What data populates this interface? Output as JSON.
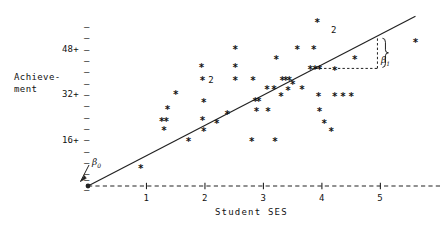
{
  "chart_data": {
    "type": "scatter",
    "title": "",
    "xlabel": "Student SES",
    "ylabel_line1": "Achieve-",
    "ylabel_line2": "ment",
    "xlim": [
      0,
      5.9
    ],
    "ylim": [
      0,
      60
    ],
    "xticks": [
      "1",
      "2",
      "3",
      "4",
      "5"
    ],
    "xtick_values": [
      1,
      2,
      3,
      4,
      5
    ],
    "ytick_labels": [
      "48+",
      "32+",
      "16+"
    ],
    "ytick_values": [
      48,
      32,
      16
    ],
    "ytick_dash_values": [
      56,
      52,
      48,
      44,
      40,
      36,
      32,
      28,
      24,
      20,
      16,
      12,
      8,
      4
    ],
    "grid": false,
    "legend": false,
    "marker_glyph": "*",
    "line_color": "#222222",
    "axis_color": "#222222",
    "marker_color": "#111111",
    "regression_line": {
      "intercept": 0,
      "slope": 10.7,
      "x_start": 0,
      "x_end": 5.6
    },
    "annotations": [
      {
        "name": "beta0",
        "text": "β",
        "sub": "0",
        "x": 0.18,
        "y": 6.5,
        "arrow_to_x": 0.02,
        "arrow_to_y": 0.6
      },
      {
        "name": "beta1",
        "text": "β",
        "sub": "1",
        "x": 5.25,
        "y": 44.0
      }
    ],
    "slope_triangle": {
      "x_left": 3.88,
      "x_right": 4.95,
      "y_bottom": 41.5,
      "y_top": 52.5,
      "style": "dashed"
    },
    "points": [
      {
        "x": 0.9,
        "y": 6.0,
        "n": 1
      },
      {
        "x": 1.26,
        "y": 22.5,
        "n": 1
      },
      {
        "x": 1.34,
        "y": 22.5,
        "n": 1
      },
      {
        "x": 1.3,
        "y": 19.5,
        "n": 1
      },
      {
        "x": 1.36,
        "y": 27.0,
        "n": 1
      },
      {
        "x": 1.5,
        "y": 32.0,
        "n": 1
      },
      {
        "x": 1.72,
        "y": 15.5,
        "n": 1
      },
      {
        "x": 1.96,
        "y": 22.8,
        "n": 1
      },
      {
        "x": 1.98,
        "y": 19.2,
        "n": 1
      },
      {
        "x": 1.98,
        "y": 29.3,
        "n": 1
      },
      {
        "x": 1.96,
        "y": 37.2,
        "n": 1
      },
      {
        "x": 1.94,
        "y": 41.6,
        "n": 1
      },
      {
        "x": 2.2,
        "y": 22.0,
        "n": 1
      },
      {
        "x": 2.38,
        "y": 25.0,
        "n": 1
      },
      {
        "x": 2.1,
        "y": 37.2,
        "n": 2
      },
      {
        "x": 2.52,
        "y": 48.0,
        "n": 1
      },
      {
        "x": 2.52,
        "y": 41.6,
        "n": 1
      },
      {
        "x": 2.52,
        "y": 37.2,
        "n": 1
      },
      {
        "x": 2.8,
        "y": 15.5,
        "n": 1
      },
      {
        "x": 2.82,
        "y": 37.2,
        "n": 1
      },
      {
        "x": 2.86,
        "y": 29.7,
        "n": 1
      },
      {
        "x": 2.92,
        "y": 29.7,
        "n": 1
      },
      {
        "x": 2.88,
        "y": 26.0,
        "n": 1
      },
      {
        "x": 3.08,
        "y": 26.0,
        "n": 1
      },
      {
        "x": 3.06,
        "y": 34.0,
        "n": 1
      },
      {
        "x": 3.18,
        "y": 34.0,
        "n": 1
      },
      {
        "x": 3.2,
        "y": 15.5,
        "n": 1
      },
      {
        "x": 3.22,
        "y": 44.5,
        "n": 1
      },
      {
        "x": 3.3,
        "y": 31.5,
        "n": 1
      },
      {
        "x": 3.32,
        "y": 37.2,
        "n": 1
      },
      {
        "x": 3.38,
        "y": 37.2,
        "n": 1
      },
      {
        "x": 3.44,
        "y": 37.2,
        "n": 1
      },
      {
        "x": 3.5,
        "y": 35.5,
        "n": 1
      },
      {
        "x": 3.42,
        "y": 33.5,
        "n": 1
      },
      {
        "x": 3.58,
        "y": 48.0,
        "n": 1
      },
      {
        "x": 3.66,
        "y": 34.0,
        "n": 1
      },
      {
        "x": 3.86,
        "y": 48.0,
        "n": 1
      },
      {
        "x": 3.8,
        "y": 41.0,
        "n": 1
      },
      {
        "x": 3.88,
        "y": 41.0,
        "n": 1
      },
      {
        "x": 3.96,
        "y": 41.0,
        "n": 1
      },
      {
        "x": 3.92,
        "y": 57.5,
        "n": 1
      },
      {
        "x": 3.94,
        "y": 31.5,
        "n": 1
      },
      {
        "x": 3.96,
        "y": 26.0,
        "n": 1
      },
      {
        "x": 4.04,
        "y": 22.0,
        "n": 1
      },
      {
        "x": 4.16,
        "y": 19.0,
        "n": 1
      },
      {
        "x": 4.22,
        "y": 40.5,
        "n": 1
      },
      {
        "x": 4.22,
        "y": 31.5,
        "n": 1
      },
      {
        "x": 4.36,
        "y": 31.5,
        "n": 1
      },
      {
        "x": 4.5,
        "y": 31.5,
        "n": 1
      },
      {
        "x": 4.56,
        "y": 44.5,
        "n": 1
      },
      {
        "x": 4.2,
        "y": 55.0,
        "n": 2
      },
      {
        "x": 5.6,
        "y": 50.5,
        "n": 1
      }
    ]
  }
}
